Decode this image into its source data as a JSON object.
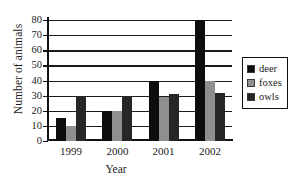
{
  "chart_data": {
    "type": "bar",
    "title": "",
    "xlabel": "Year",
    "ylabel": "Number of animals",
    "categories": [
      "1999",
      "2000",
      "2001",
      "2002"
    ],
    "series": [
      {
        "name": "deer",
        "color": "#0d0d0d",
        "values": [
          15,
          20,
          40,
          80
        ]
      },
      {
        "name": "foxes",
        "color": "#8f8f8f",
        "values": [
          10,
          20,
          29,
          40
        ]
      },
      {
        "name": "owls",
        "color": "#262626",
        "values": [
          30,
          30,
          31,
          32
        ]
      }
    ],
    "ylim": [
      0,
      80
    ],
    "ytick_step": 10,
    "yticks": [
      "80",
      "70",
      "60",
      "50",
      "40",
      "30",
      "20",
      "10",
      "0"
    ],
    "grid": "horizontal",
    "legend_position": "right"
  },
  "legend": {
    "entries": [
      {
        "label": "deer"
      },
      {
        "label": "foxes"
      },
      {
        "label": "owls"
      }
    ]
  },
  "colors": {
    "axis": "#111111",
    "grid": "#1b1b1b",
    "background": "#ffffff",
    "deer": "#0d0d0d",
    "foxes": "#8f8f8f",
    "owls": "#262626"
  }
}
